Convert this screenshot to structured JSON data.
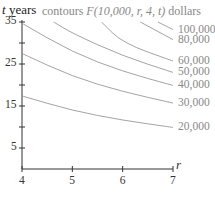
{
  "chart_data": {
    "type": "line",
    "title": "contours F(10,000, r, 4, t) dollars",
    "title_parts": {
      "prefix": "contours ",
      "func": "F(10,000, r, 4, t)",
      "suffix": " dollars"
    },
    "xlabel": "r",
    "ylabel": "t years",
    "xlim": [
      4,
      7
    ],
    "ylim": [
      0,
      35
    ],
    "x_ticks": [
      4,
      5,
      6,
      7
    ],
    "y_ticks": [
      5,
      15,
      25,
      35
    ],
    "y_minor_ticks": [
      10,
      20,
      30
    ],
    "grid": false,
    "legend": "inline labels at right end of each contour",
    "series": [
      {
        "name": "20,000",
        "points": [
          [
            4,
            17.4
          ],
          [
            5,
            13.9
          ],
          [
            6,
            11.6
          ],
          [
            7,
            9.9
          ]
        ]
      },
      {
        "name": "30,000",
        "points": [
          [
            4,
            27.5
          ],
          [
            5,
            22.0
          ],
          [
            6,
            18.4
          ],
          [
            7,
            15.7
          ]
        ]
      },
      {
        "name": "40,000",
        "points": [
          [
            4,
            34.7
          ],
          [
            5,
            27.8
          ],
          [
            6,
            23.2
          ],
          [
            7,
            19.9
          ]
        ]
      },
      {
        "name": "50,000",
        "points": [
          [
            4.63,
            35
          ],
          [
            5,
            32.3
          ],
          [
            6,
            26.9
          ],
          [
            7,
            23.0
          ]
        ]
      },
      {
        "name": "60,000",
        "points": [
          [
            5.58,
            35
          ],
          [
            6,
            30.0
          ],
          [
            7,
            25.7
          ]
        ]
      },
      {
        "name": "80,000",
        "points": [
          [
            6.35,
            35
          ],
          [
            7,
            30.8
          ]
        ]
      },
      {
        "name": "100,000",
        "points": [
          [
            6.7,
            35
          ],
          [
            7,
            33.2
          ]
        ]
      }
    ]
  }
}
